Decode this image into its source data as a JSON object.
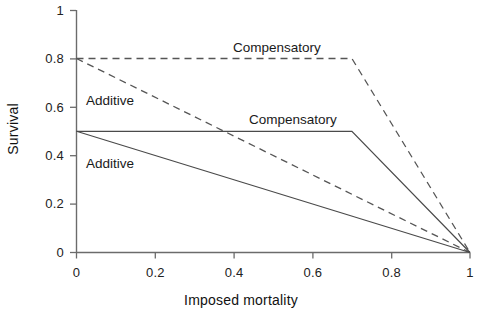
{
  "chart_data": {
    "type": "line",
    "title": "",
    "xlabel": "Imposed mortality",
    "ylabel": "Survival",
    "xlim": [
      0,
      1
    ],
    "ylim": [
      0,
      1
    ],
    "xticks": [
      "0",
      "0.2",
      "0.4",
      "0.6",
      "0.8",
      "1"
    ],
    "xtick_values": [
      0,
      0.2,
      0.4,
      0.6,
      0.8,
      1
    ],
    "yticks": [
      "0",
      "0.2",
      "0.4",
      "0.6",
      "0.8",
      "1"
    ],
    "ytick_values": [
      0,
      0.2,
      0.4,
      0.6,
      0.8,
      1
    ],
    "grid": false,
    "legend_position": "inline-annotations",
    "series": [
      {
        "name": "Compensatory (high survival)",
        "style": "dashed",
        "color": "#555555",
        "x": [
          0,
          0.7,
          1
        ],
        "y": [
          0.8,
          0.8,
          0
        ]
      },
      {
        "name": "Additive (high survival)",
        "style": "dashed",
        "color": "#555555",
        "x": [
          0,
          1
        ],
        "y": [
          0.8,
          0
        ]
      },
      {
        "name": "Compensatory (low survival)",
        "style": "solid",
        "color": "#4a4a4a",
        "x": [
          0,
          0.7,
          1
        ],
        "y": [
          0.5,
          0.5,
          0
        ]
      },
      {
        "name": "Additive (low survival)",
        "style": "solid",
        "color": "#4a4a4a",
        "x": [
          0,
          1
        ],
        "y": [
          0.5,
          0
        ]
      }
    ],
    "annotations": [
      {
        "text": "Compensatory",
        "x": 0.4,
        "y": 0.865
      },
      {
        "text": "Additive",
        "x": 0.04,
        "y": 0.605
      },
      {
        "text": "Compensatory",
        "x": 0.445,
        "y": 0.565
      },
      {
        "text": "Additive",
        "x": 0.04,
        "y": 0.345
      }
    ]
  },
  "axes": {
    "x_title": "Imposed mortality",
    "y_title": "Survival",
    "x_tick_labels": [
      "0",
      "0.2",
      "0.4",
      "0.6",
      "0.8",
      "1"
    ],
    "y_tick_labels": [
      "1",
      "0.8",
      "0.6",
      "0.4",
      "0.2",
      "0"
    ]
  },
  "annotation_labels": {
    "compensatory_upper": "Compensatory",
    "additive_upper": "Additive",
    "compensatory_lower": "Compensatory",
    "additive_lower": "Additive"
  },
  "colors": {
    "axis": "#6b6b6b",
    "solid_line": "#4a4a4a",
    "dashed_line": "#555555",
    "text": "#1a1a1a",
    "background": "#ffffff"
  }
}
